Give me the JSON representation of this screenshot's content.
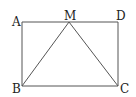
{
  "diagram": {
    "type": "geometry",
    "points": {
      "A": {
        "label": "A",
        "x": 22,
        "y": 22
      },
      "M": {
        "label": "M",
        "x": 69,
        "y": 22
      },
      "D": {
        "label": "D",
        "x": 118,
        "y": 22
      },
      "B": {
        "label": "B",
        "x": 22,
        "y": 86
      },
      "C": {
        "label": "C",
        "x": 118,
        "y": 86
      }
    },
    "segments": [
      "AD",
      "DC",
      "CB",
      "BA",
      "MB",
      "MC"
    ],
    "colors": {
      "line": "#555555",
      "label": "#222222",
      "background": "#ffffff"
    }
  }
}
